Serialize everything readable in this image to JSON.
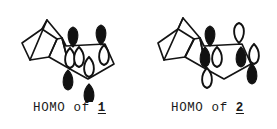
{
  "figure": {
    "type": "molecular-orbital-diagram",
    "background_color": "#ffffff",
    "line_color": "#141414",
    "lobe_filled_color": "#111111",
    "lobe_open_color": "#ffffff",
    "panels": [
      {
        "id": "panel-1",
        "caption_prefix": "HOMO of ",
        "caption_number": "1",
        "structure": "bicyclo[2.2.1] cage fused to cyclopentene ring with p-orbital lobes",
        "skeleton": [
          "M 30 58 L 22 41 L 42 27 L 57 37 L 49 55 Z",
          "M 42 27 L 47 18 L 62 36 L 57 37",
          "M 47 18 L 30 58",
          "M 57 37 L 49 55 L 70 67",
          "M 62 36 L 70 67",
          "M 62 36 L 66 44 L 105 42 L 114 62 L 88 77 L 70 67 Z"
        ],
        "lobes": [
          {
            "name": "lobe-top-left-filled",
            "cx": 73,
            "cy": 35,
            "dir": "up",
            "fill": "filled"
          },
          {
            "name": "lobe-top-right-filled",
            "cx": 101,
            "cy": 33,
            "dir": "up",
            "fill": "filled"
          },
          {
            "name": "lobe-mid-left-open",
            "cx": 70,
            "cy": 56,
            "dir": "down",
            "fill": "open"
          },
          {
            "name": "lobe-mid-left2-open",
            "cx": 79,
            "cy": 55,
            "dir": "down",
            "fill": "open"
          },
          {
            "name": "lobe-mid-right-open",
            "cx": 104,
            "cy": 53,
            "dir": "down",
            "fill": "open"
          },
          {
            "name": "lobe-center-open",
            "cx": 89,
            "cy": 65,
            "dir": "down",
            "fill": "open"
          },
          {
            "name": "lobe-lower-left-filled",
            "cx": 68,
            "cy": 78,
            "dir": "down",
            "fill": "filled"
          },
          {
            "name": "lobe-bottom-filled",
            "cx": 89,
            "cy": 92,
            "dir": "down",
            "fill": "filled"
          }
        ]
      },
      {
        "id": "panel-2",
        "caption_prefix": "HOMO of ",
        "caption_number": "2",
        "structure": "bicyclo[2.2.1] cage fused to cyclopentene ring with p-orbital lobes",
        "skeleton": [
          "M 26 58 L 20 41 L 40 27 L 56 37 L 47 55 Z",
          "M 40 27 L 45 16 L 62 36 L 56 37",
          "M 45 16 L 26 58",
          "M 56 37 L 47 55 L 68 67",
          "M 62 36 L 68 67",
          "M 62 36 L 66 44 L 104 42 L 113 62 L 86 77 L 68 67 Z"
        ],
        "lobes": [
          {
            "name": "lobe-top-left-filled",
            "cx": 72,
            "cy": 34,
            "dir": "up",
            "fill": "filled"
          },
          {
            "name": "lobe-top-right-open",
            "cx": 101,
            "cy": 31,
            "dir": "up",
            "fill": "open"
          },
          {
            "name": "lobe-mid-left-filled",
            "cx": 67,
            "cy": 55,
            "dir": "down",
            "fill": "filled"
          },
          {
            "name": "lobe-mid-left2-open",
            "cx": 79,
            "cy": 55,
            "dir": "down",
            "fill": "open"
          },
          {
            "name": "lobe-mid-right-filled",
            "cx": 103,
            "cy": 55,
            "dir": "down",
            "fill": "filled"
          },
          {
            "name": "lobe-far-right-open",
            "cx": 116,
            "cy": 52,
            "dir": "down",
            "fill": "open"
          },
          {
            "name": "lobe-lower-left-open",
            "cx": 69,
            "cy": 76,
            "dir": "down",
            "fill": "open"
          },
          {
            "name": "lobe-lower-right-filled",
            "cx": 114,
            "cy": 72,
            "dir": "down",
            "fill": "filled"
          }
        ]
      }
    ]
  }
}
